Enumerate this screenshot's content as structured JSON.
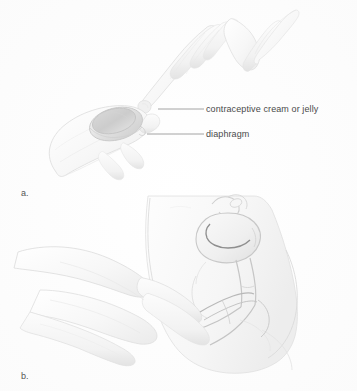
{
  "figure": {
    "background_color": "#ffffff",
    "width": 357,
    "height": 391,
    "style": "faint pencil line-art medical illustration"
  },
  "labels": {
    "cream": "contraceptive cream or jelly",
    "diaphragm": "diaphragm"
  },
  "panels": [
    {
      "letter": "a.",
      "caption_position": {
        "x": 21,
        "y": 188
      },
      "description": "Hand holding a diaphragm dome while a second hand applies contraceptive cream or jelly to its rim"
    },
    {
      "letter": "b.",
      "caption_position": {
        "x": 21,
        "y": 371
      },
      "description": "Sagittal cross-section of the female pelvis showing a hand inserting the folded diaphragm into the vagina toward the cervix"
    }
  ],
  "panel_letters": {
    "a": "a.",
    "b": "b."
  },
  "leader_lines": [
    {
      "name": "cream-leader",
      "x1": 158,
      "y1": 109,
      "x2": 204,
      "y2": 109
    },
    {
      "name": "diaphragm-leader",
      "x1": 147,
      "y1": 134,
      "x2": 204,
      "y2": 134
    }
  ],
  "colors": {
    "text": "#4a4a4a",
    "leader_line": "#9a9a9a",
    "outline_dark": "#b8b8b8",
    "outline_mid": "#d2d2d2",
    "outline_light": "#e4e4e4",
    "shade_light": "#f2f2f2",
    "shade_mid": "#e8e8e8",
    "shade_deep": "#d8d8d8",
    "background": "#ffffff"
  }
}
